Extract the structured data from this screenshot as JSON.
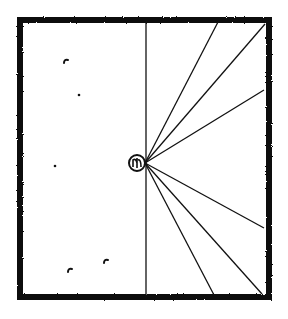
{
  "diagram": {
    "canvas": {
      "width": 288,
      "height": 319
    },
    "colors": {
      "ink": "#111111",
      "paper": "#ffffff"
    },
    "frame": {
      "x": 17,
      "y": 17,
      "width": 255,
      "height": 283,
      "thickness": 6
    },
    "vertical_line": {
      "x": 146,
      "y1": 20,
      "y2": 297
    },
    "origin": {
      "x": 145,
      "y": 163
    },
    "center_glyph": {
      "cx": 137,
      "cy": 163,
      "r": 8,
      "label": "circled-symbol"
    },
    "rays": [
      {
        "x2": 218,
        "y2": 22
      },
      {
        "x2": 265,
        "y2": 24
      },
      {
        "x2": 264,
        "y2": 90
      },
      {
        "x2": 264,
        "y2": 228
      },
      {
        "x2": 262,
        "y2": 294
      },
      {
        "x2": 214,
        "y2": 295
      }
    ],
    "marks": [
      {
        "x": 66,
        "y": 61,
        "shape": "comma"
      },
      {
        "x": 79,
        "y": 95,
        "shape": "dot"
      },
      {
        "x": 55,
        "y": 166,
        "shape": "dot"
      },
      {
        "x": 70,
        "y": 270,
        "shape": "comma"
      },
      {
        "x": 106,
        "y": 261,
        "shape": "comma"
      }
    ]
  }
}
